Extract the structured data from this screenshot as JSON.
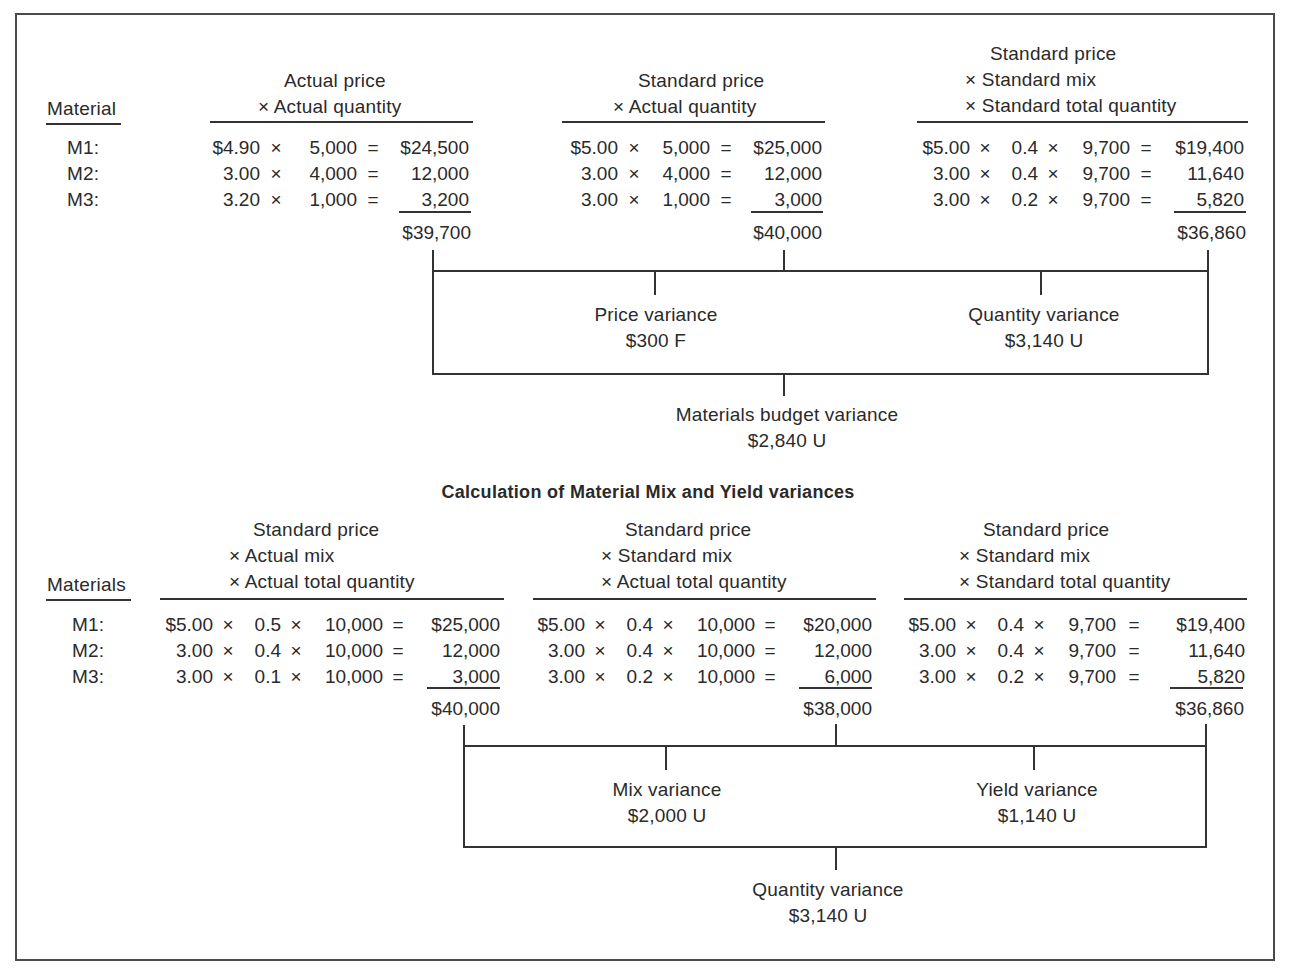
{
  "budget_section": {
    "label_header": "Material",
    "materials": [
      "M1:",
      "M2:",
      "M3:"
    ],
    "columns": [
      {
        "header_lines": [
          "Actual price",
          "× Actual quantity"
        ],
        "rows": [
          {
            "price": "$4.90",
            "qty": "5,000",
            "total": "$24,500"
          },
          {
            "price": "3.00",
            "qty": "4,000",
            "total": "12,000"
          },
          {
            "price": "3.20",
            "qty": "1,000",
            "total": "3,200"
          }
        ],
        "sum": "$39,700"
      },
      {
        "header_lines": [
          "Standard price",
          "× Actual quantity"
        ],
        "rows": [
          {
            "price": "$5.00",
            "qty": "5,000",
            "total": "$25,000"
          },
          {
            "price": "3.00",
            "qty": "4,000",
            "total": "12,000"
          },
          {
            "price": "3.00",
            "qty": "1,000",
            "total": "3,000"
          }
        ],
        "sum": "$40,000"
      },
      {
        "header_lines": [
          "Standard price",
          "× Standard mix",
          "× Standard total quantity"
        ],
        "rows": [
          {
            "price": "$5.00",
            "mix": "0.4",
            "qty": "9,700",
            "total": "$19,400"
          },
          {
            "price": "3.00",
            "mix": "0.4",
            "qty": "9,700",
            "total": "11,640"
          },
          {
            "price": "3.00",
            "mix": "0.2",
            "qty": "9,700",
            "total": "5,820"
          }
        ],
        "sum": "$36,860"
      }
    ],
    "variances": {
      "left": {
        "label": "Price variance",
        "value": "$300 F"
      },
      "right": {
        "label": "Quantity variance",
        "value": "$3,140 U"
      },
      "total": {
        "label": "Materials budget variance",
        "value": "$2,840 U"
      }
    }
  },
  "mix_yield_section": {
    "title": "Calculation of Material Mix and Yield variances",
    "label_header": "Materials",
    "materials": [
      "M1:",
      "M2:",
      "M3:"
    ],
    "columns": [
      {
        "header_lines": [
          "Standard price",
          "× Actual mix",
          "× Actual total quantity"
        ],
        "rows": [
          {
            "price": "$5.00",
            "mix": "0.5",
            "qty": "10,000",
            "total": "$25,000"
          },
          {
            "price": "3.00",
            "mix": "0.4",
            "qty": "10,000",
            "total": "12,000"
          },
          {
            "price": "3.00",
            "mix": "0.1",
            "qty": "10,000",
            "total": "3,000"
          }
        ],
        "sum": "$40,000"
      },
      {
        "header_lines": [
          "Standard price",
          "× Standard mix",
          "× Actual total quantity"
        ],
        "rows": [
          {
            "price": "$5.00",
            "mix": "0.4",
            "qty": "10,000",
            "total": "$20,000"
          },
          {
            "price": "3.00",
            "mix": "0.4",
            "qty": "10,000",
            "total": "12,000"
          },
          {
            "price": "3.00",
            "mix": "0.2",
            "qty": "10,000",
            "total": "6,000"
          }
        ],
        "sum": "$38,000"
      },
      {
        "header_lines": [
          "Standard price",
          "× Standard mix",
          "× Standard total quantity"
        ],
        "rows": [
          {
            "price": "$5.00",
            "mix": "0.4",
            "qty": "9,700",
            "total": "$19,400"
          },
          {
            "price": "3.00",
            "mix": "0.4",
            "qty": "9,700",
            "total": "11,640"
          },
          {
            "price": "3.00",
            "mix": "0.2",
            "qty": "9,700",
            "total": "5,820"
          }
        ],
        "sum": "$36,860"
      }
    ],
    "variances": {
      "left": {
        "label": "Mix variance",
        "value": "$2,000 U"
      },
      "right": {
        "label": "Yield variance",
        "value": "$1,140 U"
      },
      "total": {
        "label": "Quantity variance",
        "value": "$3,140 U"
      }
    }
  },
  "symbols": {
    "times": "×",
    "equals": "="
  }
}
